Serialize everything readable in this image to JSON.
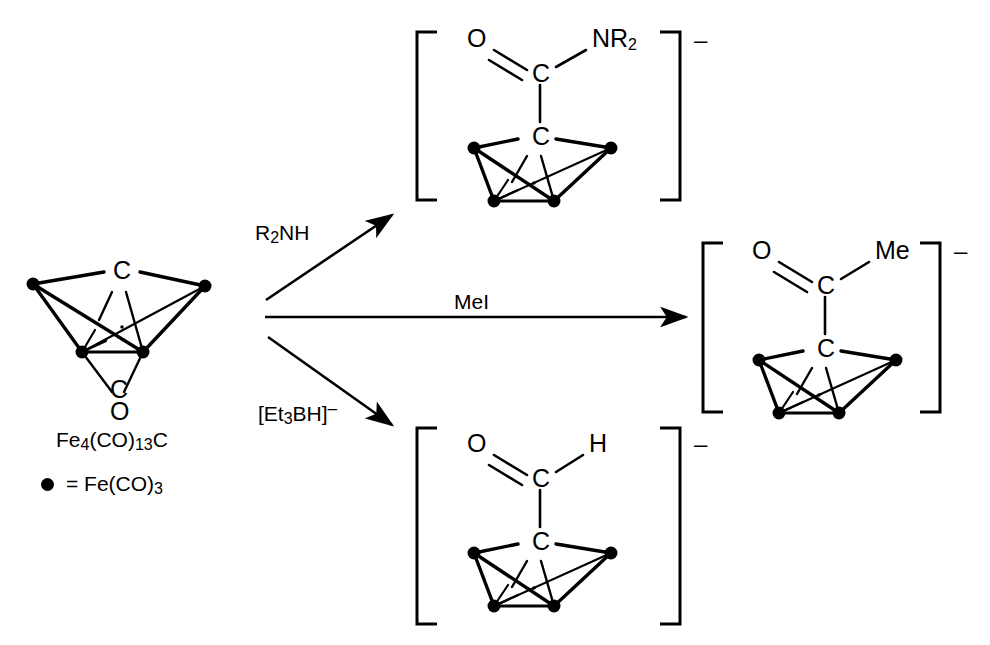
{
  "scheme": {
    "title": "Reactions of Fe4(CO)13C butterfly carbide cluster",
    "stroke_color": "#000000",
    "background": "#ffffff"
  },
  "reactant": {
    "name": "iron-carbide-cluster",
    "formula_main": "Fe",
    "formula_sub1": "4",
    "formula_mid": "(CO)",
    "formula_sub2": "13",
    "formula_end": "C",
    "carbide_label": "C",
    "carbonyl_label_c": "C",
    "carbonyl_label_o": "O"
  },
  "legend": {
    "marker": "filled-circle",
    "equals": "=",
    "group_main": "Fe(CO)",
    "group_sub": "3"
  },
  "arrows": [
    {
      "name": "arrow-amine",
      "label_main": "R",
      "label_sub": "2",
      "label_end": "NH",
      "direction": "up-right"
    },
    {
      "name": "arrow-methyl-iodide",
      "label_main": "MeI",
      "label_sub": "",
      "label_end": "",
      "direction": "right"
    },
    {
      "name": "arrow-hydride",
      "label_main": "[Et",
      "label_sub": "3",
      "label_end": "BH]",
      "label_charge": "–",
      "direction": "down-right"
    }
  ],
  "products": [
    {
      "name": "carbamoyl-cluster",
      "position": "top",
      "oxygen": "O",
      "acyl_carbon": "C",
      "substituent_main": "NR",
      "substituent_sub": "2",
      "carbide": "C",
      "charge": "–"
    },
    {
      "name": "acetyl-cluster",
      "position": "right",
      "oxygen": "O",
      "acyl_carbon": "C",
      "substituent_main": "Me",
      "substituent_sub": "",
      "carbide": "C",
      "charge": "–"
    },
    {
      "name": "formyl-cluster",
      "position": "bottom",
      "oxygen": "O",
      "acyl_carbon": "C",
      "substituent_main": "H",
      "substituent_sub": "",
      "carbide": "C",
      "charge": "–"
    }
  ]
}
